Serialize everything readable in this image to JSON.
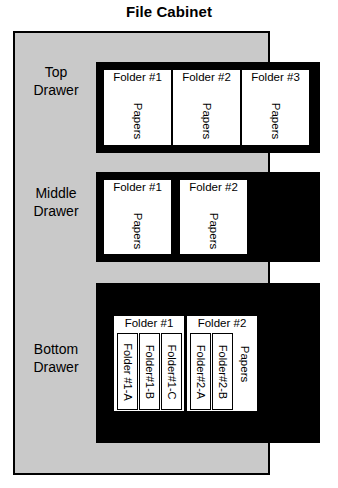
{
  "diagram": {
    "title": "File Cabinet",
    "type": "hierarchy-illustration",
    "colors": {
      "cabinet_body": "#c9c9c9",
      "drawer_interior": "#000000",
      "folder": "#ffffff",
      "outline": "#000000"
    }
  },
  "drawers": [
    {
      "label_line1": "Top",
      "label_line2": "Drawer",
      "folders": [
        {
          "title": "Folder #1",
          "contents_label": "Papers",
          "subfolders": []
        },
        {
          "title": "Folder #2",
          "contents_label": "Papers",
          "subfolders": []
        },
        {
          "title": "Folder #3",
          "contents_label": "Papers",
          "subfolders": []
        }
      ]
    },
    {
      "label_line1": "Middle",
      "label_line2": "Drawer",
      "folders": [
        {
          "title": "Folder #1",
          "contents_label": "Papers",
          "subfolders": []
        },
        {
          "title": "Folder #2",
          "contents_label": "Papers",
          "subfolders": []
        }
      ]
    },
    {
      "label_line1": "Bottom",
      "label_line2": "Drawer",
      "folders": [
        {
          "title": "Folder #1",
          "contents_label": "",
          "subfolders": [
            {
              "label": "Folder #1-A"
            },
            {
              "label": "Folder#1-B"
            },
            {
              "label": "Folder#1-C"
            }
          ]
        },
        {
          "title": "Folder #2",
          "contents_label": "Papers",
          "subfolders": [
            {
              "label": "Folder#2-A"
            },
            {
              "label": "Folder#2-B"
            }
          ]
        }
      ]
    }
  ]
}
